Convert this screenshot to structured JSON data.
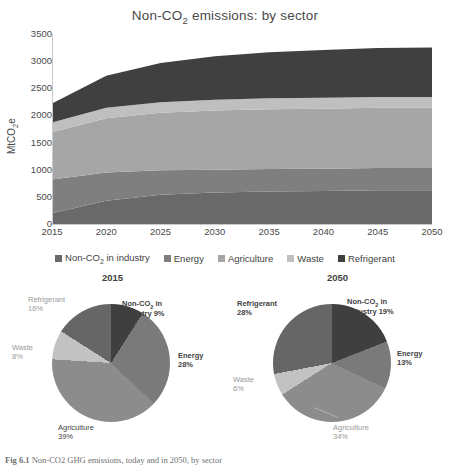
{
  "chart_data": [
    {
      "type": "area",
      "title": "Non-CO2 emissions: by sector",
      "title_main": "Non-CO",
      "title_sub": "2",
      "title_rest": " emissions: by sector",
      "xlabel": "",
      "ylabel_main": "MtCO",
      "ylabel_sub": "2",
      "ylabel_rest": "e",
      "ylabel": "MtCO2e",
      "ylim": [
        0,
        3500
      ],
      "yticks": [
        3500,
        3000,
        2500,
        2000,
        1500,
        1000,
        500,
        0
      ],
      "xlim": [
        2015,
        2050
      ],
      "xticks": [
        2015,
        2020,
        2025,
        2030,
        2035,
        2040,
        2045,
        2050
      ],
      "x": [
        2015,
        2020,
        2025,
        2030,
        2035,
        2040,
        2045,
        2050
      ],
      "grid": false,
      "legend_position": "bottom",
      "stacked": true,
      "series": [
        {
          "name": "Non-CO2 in industry",
          "color": "#696969",
          "values": [
            200,
            430,
            540,
            580,
            600,
            610,
            620,
            620
          ]
        },
        {
          "name": "Energy",
          "color": "#7f7f7f",
          "values": [
            620,
            520,
            450,
            420,
            415,
            410,
            410,
            410
          ]
        },
        {
          "name": "Agriculture",
          "color": "#a6a6a6",
          "values": [
            870,
            1000,
            1060,
            1090,
            1100,
            1105,
            1110,
            1110
          ]
        },
        {
          "name": "Waste",
          "color": "#bfbfbf",
          "values": [
            180,
            190,
            195,
            198,
            200,
            200,
            200,
            200
          ]
        },
        {
          "name": "Refrigerant",
          "color": "#404040",
          "values": [
            350,
            590,
            720,
            800,
            850,
            880,
            900,
            910
          ]
        }
      ]
    },
    {
      "type": "pie",
      "title": "2015",
      "labels": [
        "Non-CO2 in industry",
        "Energy",
        "Agriculture",
        "Waste",
        "Refrigerant"
      ],
      "values": [
        9,
        28,
        39,
        8,
        16
      ],
      "colors": [
        "#3f3f3f",
        "#7a7a7a",
        "#8c8c8c",
        "#c2c2c2",
        "#666666"
      ],
      "label_texts": [
        {
          "line1": "Non-CO",
          "sub": "2",
          "line1b": " in",
          "line2": "industry 9%"
        },
        {
          "line1": "Energy",
          "line2": "28%"
        },
        {
          "line1": "Agriculture",
          "line2": "39%"
        },
        {
          "line1": "Waste",
          "line2": "8%"
        },
        {
          "line1": "Refrigerant",
          "line2": "16%"
        }
      ]
    },
    {
      "type": "pie",
      "title": "2050",
      "labels": [
        "Non-CO2 in industry",
        "Energy",
        "Agriculture",
        "Waste",
        "Refrigerant"
      ],
      "values": [
        19,
        13,
        34,
        6,
        28
      ],
      "colors": [
        "#3f3f3f",
        "#7a7a7a",
        "#8c8c8c",
        "#c2c2c2",
        "#666666"
      ],
      "label_texts": [
        {
          "line1": "Non-CO",
          "sub": "2",
          "line1b": " in",
          "line2": "industry 19%"
        },
        {
          "line1": "Energy",
          "line2": "13%"
        },
        {
          "line1": "Agriculture",
          "line2": "34%"
        },
        {
          "line1": "Waste",
          "line2": "6%"
        },
        {
          "line1": "Refrigerant",
          "line2": "28%"
        }
      ]
    }
  ],
  "legend": {
    "items": [
      {
        "label": "Non-CO",
        "sub": "2",
        "rest": " in industry",
        "color": "#696969"
      },
      {
        "label": "Energy",
        "sub": "",
        "rest": "",
        "color": "#7f7f7f"
      },
      {
        "label": "Agriculture",
        "sub": "",
        "rest": "",
        "color": "#a6a6a6"
      },
      {
        "label": "Waste",
        "sub": "",
        "rest": "",
        "color": "#bfbfbf"
      },
      {
        "label": "Refrigerant",
        "sub": "",
        "rest": "",
        "color": "#404040"
      }
    ]
  },
  "caption": {
    "figure_number": "Fig 6.1",
    "text": " Non-CO2 GHG emissions, today and in 2050, by sector"
  }
}
